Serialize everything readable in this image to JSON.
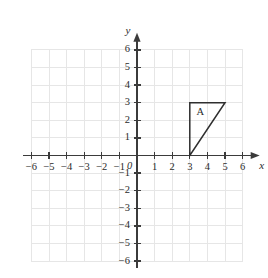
{
  "chart_data": {
    "type": "scatter",
    "title": "",
    "xlabel": "x",
    "ylabel": "y",
    "xlim": [
      -6.5,
      6.8
    ],
    "ylim": [
      -6.5,
      6.8
    ],
    "grid": true,
    "legend": null,
    "x_ticks": [
      -6,
      -5,
      -4,
      -3,
      -2,
      -1,
      1,
      2,
      3,
      4,
      5,
      6
    ],
    "y_ticks": [
      -6,
      -5,
      -4,
      -3,
      -2,
      -1,
      1,
      2,
      3,
      4,
      5,
      6
    ],
    "x_tick_labels": [
      "−6",
      "−5",
      "−4",
      "−3",
      "−2",
      "−1",
      "1",
      "2",
      "3",
      "4",
      "5",
      "6"
    ],
    "y_tick_labels": [
      "−6",
      "−5",
      "−4",
      "−3",
      "−2",
      "−1",
      "1",
      "2",
      "3",
      "4",
      "5",
      "6"
    ],
    "origin_label": "0",
    "grid_x_range": [
      -6,
      6
    ],
    "grid_y_range": [
      -6,
      6
    ],
    "shapes": [
      {
        "name": "A",
        "kind": "triangle",
        "label": "A",
        "label_position": [
          3.6,
          2.45
        ],
        "vertices": [
          [
            3,
            0
          ],
          [
            3,
            3
          ],
          [
            5,
            3
          ]
        ],
        "stroke": "#2f2f2f",
        "fill": "none"
      }
    ],
    "annotations": [
      {
        "text": "A",
        "x": 3.6,
        "y": 2.45
      }
    ]
  },
  "axes": {
    "x_axis_name": "x",
    "y_axis_name": "y",
    "origin": "0"
  },
  "colors": {
    "grid": "#e6e6e6",
    "axis": "#3b3b3b",
    "shape_stroke": "#2f2f2f",
    "text": "#2b2b2b",
    "background": "#ffffff"
  }
}
